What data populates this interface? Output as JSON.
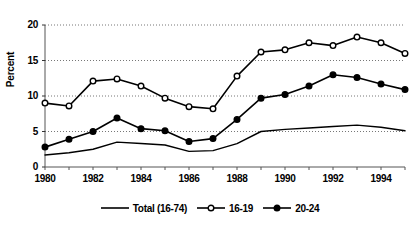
{
  "chart_data": {
    "type": "line",
    "title": "",
    "xlabel": "",
    "ylabel": "Percent",
    "xlim": [
      1980,
      1995
    ],
    "ylim": [
      0,
      20
    ],
    "grid": true,
    "grid_axis": "y",
    "legend_position": "bottom",
    "yticks": [
      "0",
      "5",
      "10",
      "15",
      "20"
    ],
    "ytick_values": [
      0,
      5,
      10,
      15,
      20
    ],
    "xticks": [
      "1980",
      "1982",
      "1984",
      "1986",
      "1988",
      "1990",
      "1992",
      "1994"
    ],
    "xtick_values": [
      1980,
      1982,
      1984,
      1986,
      1988,
      1990,
      1992,
      1994
    ],
    "x": [
      1980,
      1981,
      1982,
      1983,
      1984,
      1985,
      1986,
      1987,
      1988,
      1989,
      1990,
      1991,
      1992,
      1993,
      1994,
      1995
    ],
    "series": [
      {
        "name": "Total (16-74)",
        "marker": "none",
        "color": "#000000",
        "values": [
          1.7,
          2.0,
          2.5,
          3.5,
          3.3,
          3.1,
          2.2,
          2.3,
          3.3,
          5.0,
          5.3,
          5.5,
          5.7,
          5.9,
          5.6,
          5.1
        ]
      },
      {
        "name": "16-19",
        "marker": "open-circle",
        "color": "#000000",
        "values": [
          9.0,
          8.6,
          12.1,
          12.4,
          11.4,
          9.7,
          8.5,
          8.2,
          12.8,
          16.2,
          16.5,
          17.5,
          17.1,
          18.3,
          17.5,
          16.0
        ]
      },
      {
        "name": "20-24",
        "marker": "filled-circle",
        "color": "#000000",
        "values": [
          2.8,
          3.9,
          5.0,
          6.9,
          5.4,
          5.1,
          3.6,
          4.0,
          6.7,
          9.7,
          10.2,
          11.4,
          13.0,
          12.6,
          11.7,
          10.9
        ]
      }
    ]
  },
  "legend": {
    "items": [
      {
        "label": "Total (16-74)",
        "marker": "none"
      },
      {
        "label": "16-19",
        "marker": "open-circle"
      },
      {
        "label": "20-24",
        "marker": "filled-circle"
      }
    ]
  }
}
